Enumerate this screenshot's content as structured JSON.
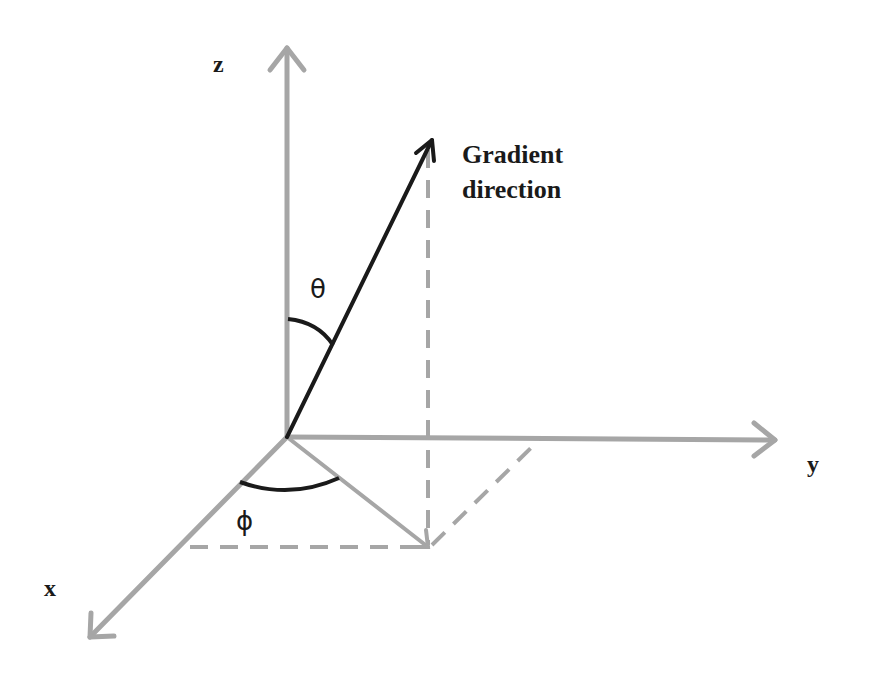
{
  "diagram": {
    "type": "3d-coordinate-system",
    "axes": {
      "x": {
        "label": "x"
      },
      "y": {
        "label": "y"
      },
      "z": {
        "label": "z"
      }
    },
    "vector": {
      "label_line1": "Gradient",
      "label_line2": "direction"
    },
    "angles": {
      "polar": {
        "symbol": "θ"
      },
      "azimuth": {
        "symbol": "ϕ"
      }
    },
    "colors": {
      "axis": "#a6a6a6",
      "vector": "#1a1a1a",
      "background": "#ffffff"
    }
  }
}
